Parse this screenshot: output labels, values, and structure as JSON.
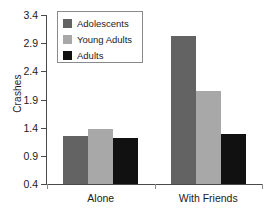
{
  "chart_data": {
    "type": "bar",
    "title": "",
    "xlabel": "",
    "ylabel": "Crashes",
    "categories": [
      "Alone",
      "With Friends"
    ],
    "series": [
      {
        "name": "Adolescents",
        "color": "#636363",
        "values": [
          1.26,
          3.03
        ]
      },
      {
        "name": "Young Adults",
        "color": "#a8a8a8",
        "values": [
          1.38,
          2.05
        ]
      },
      {
        "name": "Adults",
        "color": "#111111",
        "values": [
          1.22,
          1.28
        ]
      }
    ],
    "ylim": [
      0.4,
      3.4
    ],
    "yticks": [
      "0.4",
      "0.9",
      "1.4",
      "1.9",
      "2.4",
      "2.9",
      "3.4"
    ],
    "grid": false,
    "legend_position": "top-left"
  },
  "axis": {
    "y_title": "Crashes",
    "y_tick_labels": [
      "3.4",
      "2.9",
      "2.4",
      "1.9",
      "1.4",
      "0.9",
      "0.4"
    ],
    "x_labels": [
      "Alone",
      "With Friends"
    ]
  },
  "legend": {
    "items": [
      {
        "label": "Adolescents",
        "swatch": "adolescents"
      },
      {
        "label": "Young Adults",
        "swatch": "young"
      },
      {
        "label": "Adults",
        "swatch": "adults"
      }
    ]
  }
}
